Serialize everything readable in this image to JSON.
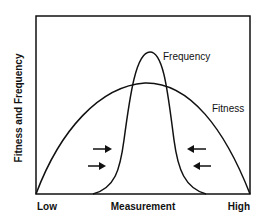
{
  "diagram": {
    "y_axis_label": "Fitness and Frequency",
    "x_axis_label": "Measurement",
    "x_low_label": "Low",
    "x_high_label": "High",
    "curves": [
      {
        "name": "Frequency",
        "label": "Frequency",
        "shape": "narrow peak"
      },
      {
        "name": "Fitness",
        "label": "Fitness",
        "shape": "broad arc"
      }
    ],
    "arrows": [
      {
        "direction": "right",
        "side": "left"
      },
      {
        "direction": "right",
        "side": "left"
      },
      {
        "direction": "left",
        "side": "right"
      },
      {
        "direction": "left",
        "side": "right"
      }
    ],
    "line_color": "#111111",
    "background": "#ffffff"
  }
}
